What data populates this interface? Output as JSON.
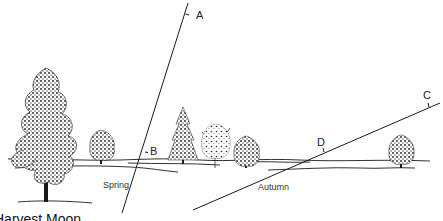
{
  "diagram": {
    "title": "Harvest Moon",
    "colors": {
      "ink": "#1a1a1a",
      "background": "#ffffff",
      "foliage": "#2b2b2b"
    },
    "paths": [
      {
        "name": "Spring",
        "label": "Spring",
        "points": [
          {
            "id": "A",
            "label": "A"
          },
          {
            "id": "B",
            "label": "B"
          }
        ]
      },
      {
        "name": "Autumn",
        "label": "Autumn",
        "points": [
          {
            "id": "C",
            "label": "C"
          },
          {
            "id": "D",
            "label": "D"
          }
        ]
      }
    ],
    "labels": {
      "A": "A",
      "B": "B",
      "C": "C",
      "D": "D",
      "spring": "Spring",
      "autumn": "Autumn",
      "caption": "Harvest Moon"
    }
  }
}
